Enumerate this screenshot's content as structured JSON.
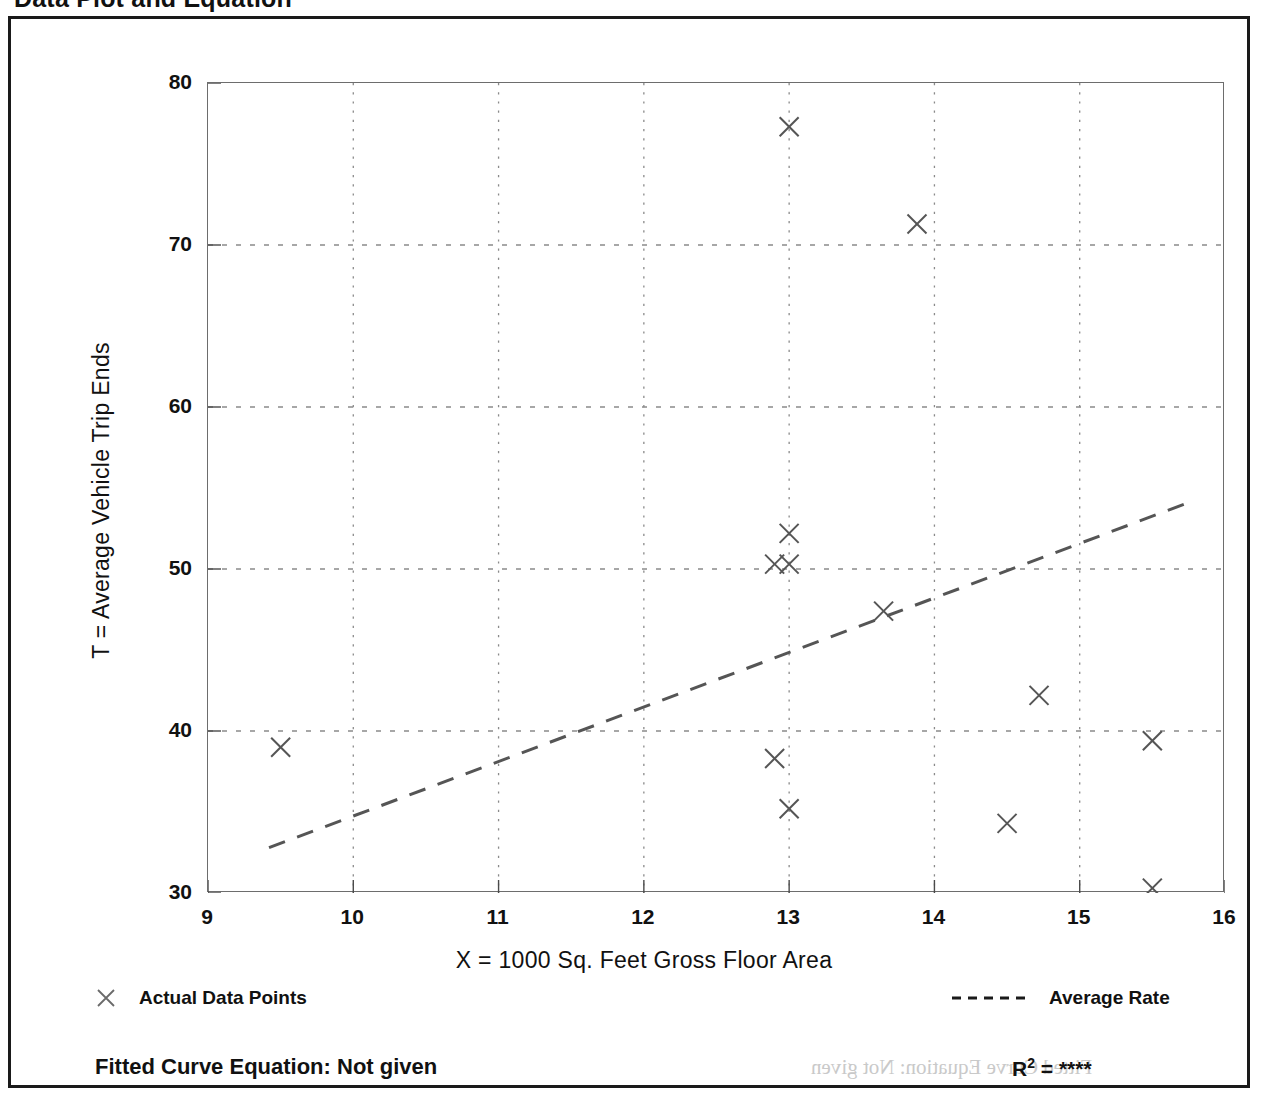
{
  "page": {
    "title": "Data Plot and Equation"
  },
  "footer": {
    "equation_label": "Fitted Curve Equation:  Not given",
    "r2_prefix": "R",
    "r2_exponent": "2",
    "r2_equals": " = ",
    "r2_value": "****",
    "ghost_equation": "Fitted Curve Equation: Not given"
  },
  "legend": {
    "points": {
      "marker": "x-marker-icon",
      "label": "Actual Data Points"
    },
    "rate": {
      "marker": "dashed-line-icon",
      "label": "Average Rate"
    }
  },
  "chart_data": {
    "type": "scatter",
    "title": "Data Plot and Equation",
    "xlabel": "X = 1000 Sq. Feet Gross Floor Area",
    "ylabel": "T = Average Vehicle Trip Ends",
    "xlim": [
      9,
      16
    ],
    "ylim": [
      30,
      80
    ],
    "xticks": [
      9,
      10,
      11,
      12,
      13,
      14,
      15,
      16
    ],
    "yticks": [
      30,
      40,
      50,
      60,
      70,
      80
    ],
    "xtick_labels": [
      "9",
      "10",
      "11",
      "12",
      "13",
      "14",
      "15",
      "16"
    ],
    "ytick_labels": [
      "30",
      "40",
      "50",
      "60",
      "70",
      "80"
    ],
    "x_minor_step": 0.5,
    "y_minor_step": 5,
    "grid": true,
    "grid_style": "dotted",
    "grid_x_values": [
      10,
      11,
      12,
      13,
      14,
      15
    ],
    "grid_y_values": [
      40,
      50,
      60,
      70
    ],
    "marker": "x",
    "marker_color": "#555555",
    "line_color": "#555555",
    "legend_position": "below-axes",
    "series": [
      {
        "name": "Actual Data Points",
        "type": "scatter",
        "points": [
          {
            "x": 9.5,
            "y": 39.0
          },
          {
            "x": 12.9,
            "y": 50.3
          },
          {
            "x": 13.0,
            "y": 50.3
          },
          {
            "x": 13.0,
            "y": 52.2
          },
          {
            "x": 13.0,
            "y": 77.3
          },
          {
            "x": 12.9,
            "y": 38.3
          },
          {
            "x": 13.0,
            "y": 35.2
          },
          {
            "x": 13.65,
            "y": 47.4
          },
          {
            "x": 13.88,
            "y": 71.3
          },
          {
            "x": 14.5,
            "y": 34.3
          },
          {
            "x": 14.72,
            "y": 42.2
          },
          {
            "x": 15.5,
            "y": 39.4
          },
          {
            "x": 15.5,
            "y": 30.3
          }
        ]
      },
      {
        "name": "Average Rate",
        "type": "line",
        "style": "dashed",
        "endpoints": [
          {
            "x": 9.42,
            "y": 32.8
          },
          {
            "x": 15.72,
            "y": 54.0
          }
        ]
      }
    ]
  }
}
